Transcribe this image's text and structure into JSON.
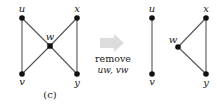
{
  "figure": {
    "caption": "(c)",
    "operation": {
      "line1": "remove",
      "line2": "uw, vw",
      "arrow_color": "#d8d8d8"
    },
    "before_graph": {
      "nodes": [
        {
          "id": "u",
          "label": "u",
          "x": 22,
          "y": 18
        },
        {
          "id": "x",
          "label": "x",
          "x": 77,
          "y": 18
        },
        {
          "id": "w",
          "label": "w",
          "x": 50,
          "y": 46
        },
        {
          "id": "v",
          "label": "v",
          "x": 22,
          "y": 74
        },
        {
          "id": "y",
          "label": "y",
          "x": 77,
          "y": 74
        }
      ],
      "edges": [
        [
          "u",
          "v"
        ],
        [
          "u",
          "w"
        ],
        [
          "w",
          "y"
        ],
        [
          "x",
          "w"
        ],
        [
          "w",
          "v"
        ],
        [
          "x",
          "y"
        ]
      ]
    },
    "after_graph": {
      "nodes": [
        {
          "id": "u",
          "label": "u",
          "x": 152,
          "y": 18
        },
        {
          "id": "v",
          "label": "v",
          "x": 152,
          "y": 74
        },
        {
          "id": "x",
          "label": "x",
          "x": 206,
          "y": 18
        },
        {
          "id": "w",
          "label": "w",
          "x": 178,
          "y": 47
        },
        {
          "id": "y",
          "label": "y",
          "x": 206,
          "y": 74
        }
      ],
      "edges": [
        [
          "u",
          "v"
        ],
        [
          "x",
          "w"
        ],
        [
          "w",
          "y"
        ],
        [
          "x",
          "y"
        ]
      ]
    },
    "colors": {
      "node": "#111111",
      "edge": "#555555",
      "text": "#222222"
    }
  }
}
